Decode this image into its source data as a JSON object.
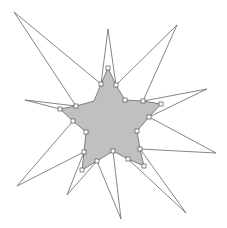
{
  "diagram": {
    "title": "",
    "colors": {
      "background": "#ffffff",
      "star_fill": "#c0c0c0",
      "stroke": "#666666",
      "handle_fill": "#ffffff",
      "handle_stroke": "#555555"
    },
    "star_polygon": [
      [
        108,
        68
      ],
      [
        116,
        85
      ],
      [
        125,
        100
      ],
      [
        143,
        101
      ],
      [
        161,
        104
      ],
      [
        149,
        117
      ],
      [
        137,
        131
      ],
      [
        140,
        149
      ],
      [
        144,
        166
      ],
      [
        128,
        159
      ],
      [
        113,
        151
      ],
      [
        97,
        161
      ],
      [
        82,
        170
      ],
      [
        84,
        152
      ],
      [
        86,
        132
      ],
      [
        73,
        121
      ],
      [
        60,
        109
      ],
      [
        76,
        106
      ],
      [
        94,
        101
      ],
      [
        101,
        84
      ]
    ],
    "handles": [
      [
        108,
        68
      ],
      [
        101,
        84
      ],
      [
        116,
        85
      ],
      [
        125,
        100
      ],
      [
        143,
        101
      ],
      [
        161,
        104
      ],
      [
        149,
        117
      ],
      [
        137,
        131
      ],
      [
        140,
        149
      ],
      [
        144,
        166
      ],
      [
        128,
        159
      ],
      [
        113,
        151
      ],
      [
        97,
        161
      ],
      [
        82,
        170
      ],
      [
        84,
        152
      ],
      [
        86,
        132
      ],
      [
        73,
        121
      ],
      [
        60,
        109
      ],
      [
        76,
        106
      ]
    ],
    "spikes": [
      [
        [
          101,
          84
        ],
        [
          14,
          12
        ],
        [
          76,
          106
        ]
      ],
      [
        [
          101,
          84
        ],
        [
          108,
          29
        ],
        [
          116,
          85
        ]
      ],
      [
        [
          116,
          85
        ],
        [
          177,
          25
        ],
        [
          143,
          101
        ]
      ],
      [
        [
          143,
          101
        ],
        [
          207,
          89
        ],
        [
          149,
          117
        ]
      ],
      [
        [
          149,
          117
        ],
        [
          216,
          153
        ],
        [
          140,
          149
        ]
      ],
      [
        [
          140,
          149
        ],
        [
          186,
          213
        ],
        [
          128,
          159
        ]
      ],
      [
        [
          97,
          161
        ],
        [
          121,
          219
        ],
        [
          113,
          151
        ]
      ],
      [
        [
          84,
          152
        ],
        [
          67,
          195
        ],
        [
          97,
          161
        ]
      ],
      [
        [
          73,
          121
        ],
        [
          17,
          186
        ],
        [
          84,
          152
        ]
      ],
      [
        [
          60,
          109
        ],
        [
          25,
          100
        ],
        [
          76,
          106
        ]
      ]
    ]
  }
}
